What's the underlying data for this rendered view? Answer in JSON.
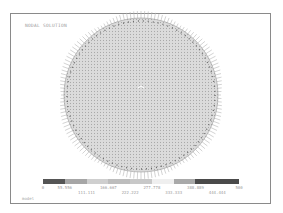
{
  "plot": {
    "title": "NODAL SOLUTION",
    "footer_label": "model",
    "center": [
      141,
      95
    ],
    "radius": 77
  },
  "legend": {
    "colors": [
      "#555555",
      "#a6a6a6",
      "#cfcfcf",
      "#bdbdbd",
      "#c8c8c8",
      "#efefef",
      "#a9a9a9",
      "#4a4a4a",
      "#4a4a4a"
    ],
    "labels": [
      "0",
      "55.556",
      "111.111",
      "166.667",
      "222.222",
      "277.778",
      "333.333",
      "388.889",
      "444.444",
      "500"
    ]
  },
  "chart_data": {
    "type": "heatmap",
    "title": "NODAL SOLUTION",
    "legend_min": 0,
    "legend_max": 500,
    "legend_ticks": [
      0,
      55.556,
      111.111,
      166.667,
      222.222,
      277.778,
      333.333,
      388.889,
      444.444,
      500
    ]
  }
}
